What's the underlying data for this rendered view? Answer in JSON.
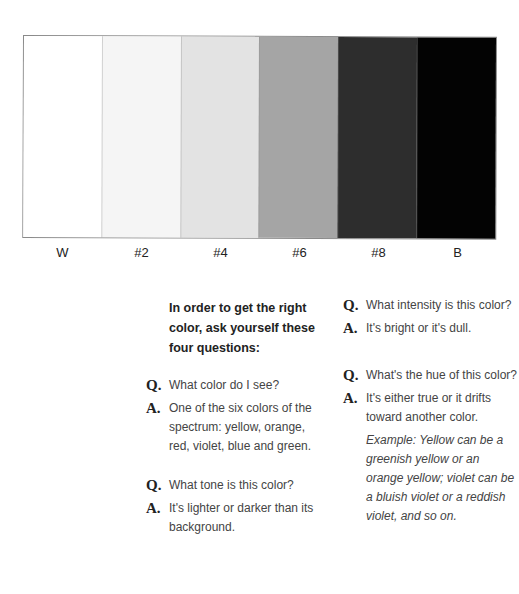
{
  "swatches": [
    {
      "label": "W",
      "color": "#ffffff"
    },
    {
      "label": "#2",
      "color": "#f5f5f5"
    },
    {
      "label": "#4",
      "color": "#e3e3e3"
    },
    {
      "label": "#6",
      "color": "#a5a5a5"
    },
    {
      "label": "#8",
      "color": "#2d2d2d"
    },
    {
      "label": "B",
      "color": "#030303"
    }
  ],
  "intro": "In order to get the right color, ask yourself these four questions:",
  "questions": [
    {
      "q_mark": "Q.",
      "q": "What color do I see?",
      "a_mark": "A.",
      "a": "One of the six colors of the spectrum: yellow, orange, red, violet, blue and green."
    },
    {
      "q_mark": "Q.",
      "q": "What tone is this color?",
      "a_mark": "A.",
      "a": "It's lighter or darker than its background."
    },
    {
      "q_mark": "Q.",
      "q": "What intensity is this color?",
      "a_mark": "A.",
      "a": "It's bright or it's dull."
    },
    {
      "q_mark": "Q.",
      "q": "What's the hue of this color?",
      "a_mark": "A.",
      "a": "It's either true or it drifts toward another color.",
      "example": "Example: Yellow can be a greenish yellow or an orange yellow; violet can be a bluish violet or a reddish violet, and so on."
    }
  ]
}
